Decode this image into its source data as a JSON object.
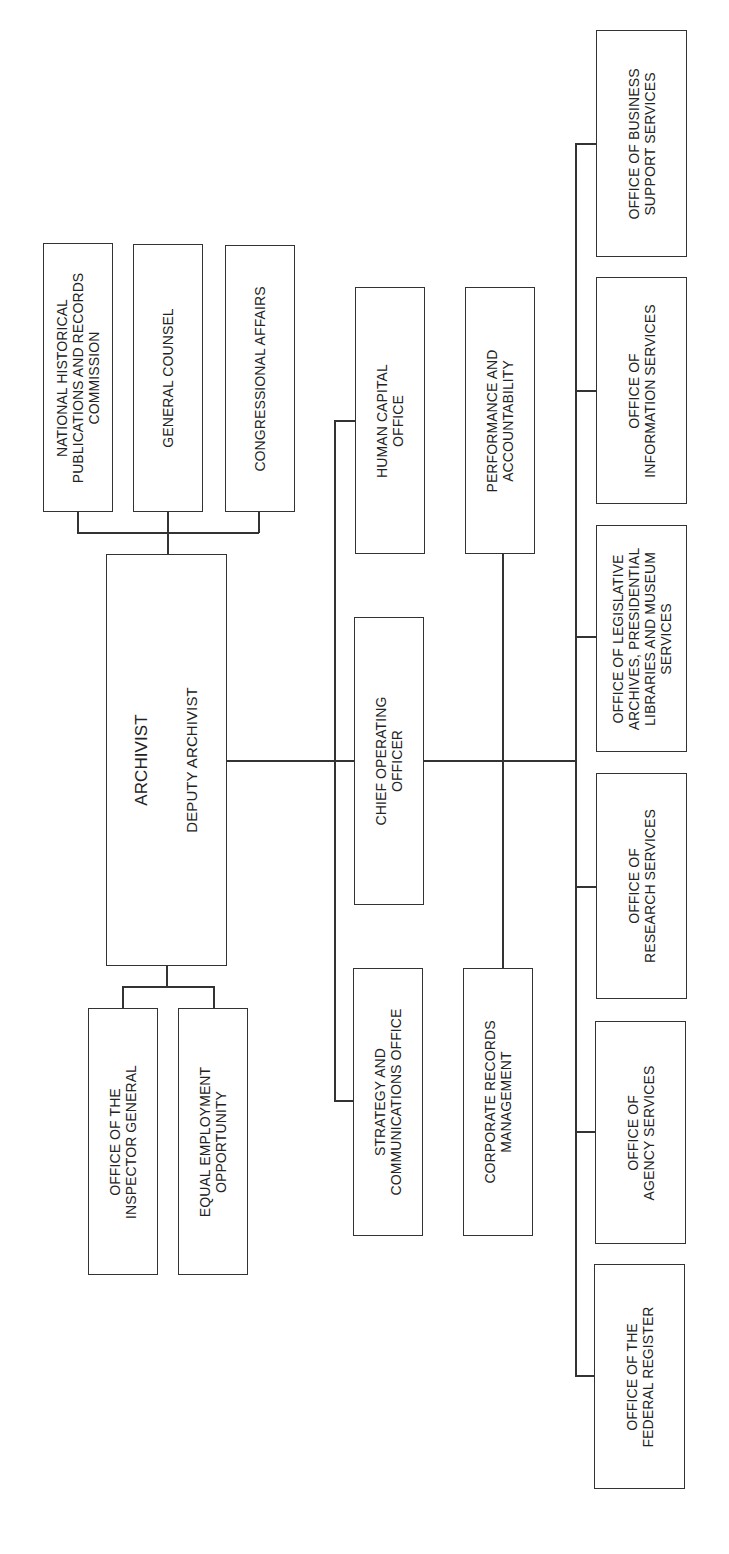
{
  "chart_title": "",
  "top_offices": [
    {
      "lines": [
        "NATIONAL HISTORICAL",
        "PUBLICATIONS AND RECORDS",
        "COMMISSION"
      ]
    },
    {
      "lines": [
        "GENERAL COUNSEL"
      ]
    },
    {
      "lines": [
        "CONGRESSIONAL AFFAIRS"
      ]
    }
  ],
  "leader": {
    "title": "ARCHIVIST",
    "subtitle": "DEPUTY ARCHIVIST"
  },
  "lower_offices": [
    {
      "lines": [
        "OFFICE OF THE",
        "INSPECTOR GENERAL"
      ]
    },
    {
      "lines": [
        "EQUAL EMPLOYMENT",
        "OPPORTUNITY"
      ]
    }
  ],
  "staff_offices": {
    "human_capital": {
      "lines": [
        "HUMAN CAPITAL",
        "OFFICE"
      ]
    },
    "performance": {
      "lines": [
        "PERFORMANCE AND",
        "ACCOUNTABILITY"
      ]
    },
    "coo": {
      "lines": [
        "CHIEF OPERATING",
        "OFFICER"
      ]
    },
    "strategy": {
      "lines": [
        "STRATEGY AND",
        "COMMUNICATIONS OFFICE"
      ]
    },
    "corporate_records": {
      "lines": [
        "CORPORATE RECORDS",
        "MANAGEMENT"
      ]
    }
  },
  "program_offices": [
    {
      "lines": [
        "OFFICE OF BUSINESS",
        "SUPPORT SERVICES"
      ]
    },
    {
      "lines": [
        "OFFICE OF",
        "INFORMATION SERVICES"
      ]
    },
    {
      "lines": [
        "OFFICE OF LEGISLATIVE",
        "ARCHIVES, PRESIDENTIAL",
        "LIBRARIES AND MUSEUM",
        "SERVICES"
      ]
    },
    {
      "lines": [
        "OFFICE OF",
        "RESEARCH SERVICES"
      ]
    },
    {
      "lines": [
        "OFFICE OF",
        "AGENCY SERVICES"
      ]
    },
    {
      "lines": [
        "OFFICE OF THE",
        "FEDERAL REGISTER"
      ]
    }
  ],
  "colors": {
    "line": "#333333",
    "text": "#222222",
    "background": "#ffffff"
  }
}
